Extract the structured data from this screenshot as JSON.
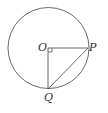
{
  "diagram": {
    "type": "geometry",
    "points": {
      "O": {
        "label": "O",
        "x": 48,
        "y": 48
      },
      "P": {
        "label": "P",
        "x": 88,
        "y": 48
      },
      "Q": {
        "label": "Q",
        "x": 48,
        "y": 89
      }
    },
    "circle": {
      "cx": 48.5,
      "cy": 48,
      "r": 40.5
    },
    "segments": [
      "OP",
      "OQ",
      "PQ"
    ],
    "right_angle_at": "O",
    "colors": {
      "stroke": "#444444",
      "text": "#333333",
      "background": "#ffffff"
    }
  }
}
